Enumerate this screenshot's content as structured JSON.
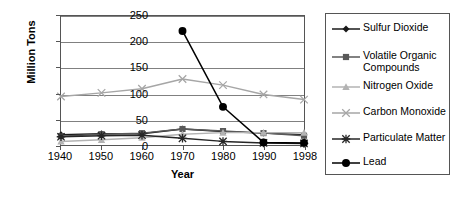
{
  "chart_data": {
    "type": "line",
    "title": "",
    "xlabel": "Year",
    "ylabel": "Million Tons",
    "categories": [
      "1940",
      "1950",
      "1960",
      "1970",
      "1980",
      "1990",
      "1998"
    ],
    "x": [
      1940,
      1950,
      1960,
      1970,
      1980,
      1990,
      1998
    ],
    "ylim": [
      0,
      250
    ],
    "yticks": [
      "0",
      "50",
      "100",
      "150",
      "200",
      "250"
    ],
    "ytick_values": [
      0,
      50,
      100,
      150,
      200,
      250
    ],
    "grid": true,
    "legend_position": "right",
    "series": [
      {
        "name": "Sulfur Dioxide",
        "marker": "filled-diamond",
        "color": "#1a1a1a",
        "values": [
          20,
          22,
          22,
          31,
          26,
          23,
          20
        ]
      },
      {
        "name": "Volatile Organic Compounds",
        "marker": "filled-square",
        "color": "#595959",
        "values": [
          17,
          21,
          23,
          31,
          27,
          23,
          18
        ]
      },
      {
        "name": "Nitrogen Oxide",
        "marker": "triangle",
        "color": "#b3b3b3",
        "values": [
          7,
          10,
          14,
          21,
          24,
          24,
          24
        ]
      },
      {
        "name": "Carbon Monoxide",
        "marker": "cross-x",
        "color": "#a6a6a6",
        "values": [
          94,
          101,
          109,
          128,
          116,
          98,
          88
        ]
      },
      {
        "name": "Particulate Matter",
        "marker": "asterisk",
        "color": "#262626",
        "values": [
          16,
          18,
          19,
          13,
          7,
          4,
          3
        ]
      },
      {
        "name": "Lead",
        "marker": "filled-circle",
        "color": "#000000",
        "values": [
          null,
          null,
          null,
          221,
          74,
          5,
          4
        ]
      }
    ]
  },
  "legend": {
    "items": [
      {
        "label": "Sulfur Dioxide"
      },
      {
        "label": "Volatile Organic Compounds"
      },
      {
        "label": "Nitrogen Oxide"
      },
      {
        "label": "Carbon Monoxide"
      },
      {
        "label": "Particulate Matter"
      },
      {
        "label": "Lead"
      }
    ]
  }
}
